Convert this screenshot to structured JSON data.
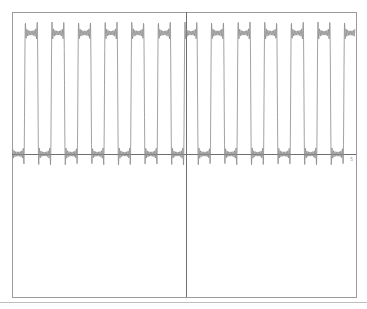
{
  "chart_data": {
    "type": "line",
    "title": "",
    "xlabel": "",
    "ylabel": "",
    "grid": false,
    "legend": null,
    "x_tick_label_right": "5",
    "series": [
      {
        "name": "square-wave-fourier-approximation",
        "color": "#8a8a8a",
        "harmonics": 9,
        "periods_visible": 13,
        "duty_cycle": 0.5,
        "level_low": 0,
        "level_high": 1
      }
    ],
    "xlim": [
      -6.5,
      6.5
    ],
    "ylim": [
      -1.0,
      1.15
    ]
  },
  "colors": {
    "frame": "#9b9b9b",
    "axes": "#6f6f6f",
    "curve": "#8a8a8a",
    "divider": "#bdbdbd"
  }
}
